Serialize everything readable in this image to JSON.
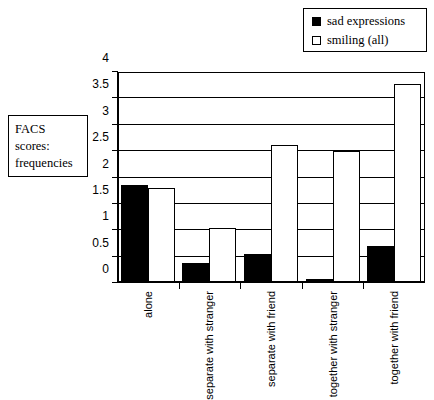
{
  "top_caption": "",
  "side_caption": {
    "lines": [
      "FACS",
      "scores:",
      "frequencies"
    ]
  },
  "legend": {
    "items": [
      {
        "label": "sad expressions",
        "swatch": "filled-square-icon",
        "color": "#000000"
      },
      {
        "label": "smiling (all)",
        "swatch": "hollow-square-icon",
        "color": "#ffffff"
      }
    ]
  },
  "chart_data": {
    "type": "bar",
    "title": "",
    "xlabel": "",
    "ylabel": "FACS scores: frequencies",
    "ylim": [
      0,
      4
    ],
    "ytick_labels": [
      "0",
      "0.5",
      "1",
      "1.5",
      "2",
      "2.5",
      "3",
      "3.5",
      "4"
    ],
    "ytick_values": [
      0,
      0.5,
      1,
      1.5,
      2,
      2.5,
      3,
      3.5,
      4
    ],
    "grid": true,
    "legend_position": "top-right",
    "categories": [
      "alone",
      "separate with stranger",
      "separate with friend",
      "together with stranger",
      "together with friend"
    ],
    "category_label_lines": [
      [
        "alone"
      ],
      [
        "separate",
        "with",
        "stranger"
      ],
      [
        "separate",
        "with friend"
      ],
      [
        "together",
        "with",
        "stranger"
      ],
      [
        "together",
        "with friend"
      ]
    ],
    "series": [
      {
        "name": "sad expressions",
        "color": "#000000",
        "values": [
          1.86,
          0.38,
          0.55,
          0.08,
          0.7
        ]
      },
      {
        "name": "smiling (all)",
        "color": "#ffffff",
        "values": [
          1.8,
          1.05,
          2.62,
          2.5,
          3.78
        ]
      }
    ]
  }
}
